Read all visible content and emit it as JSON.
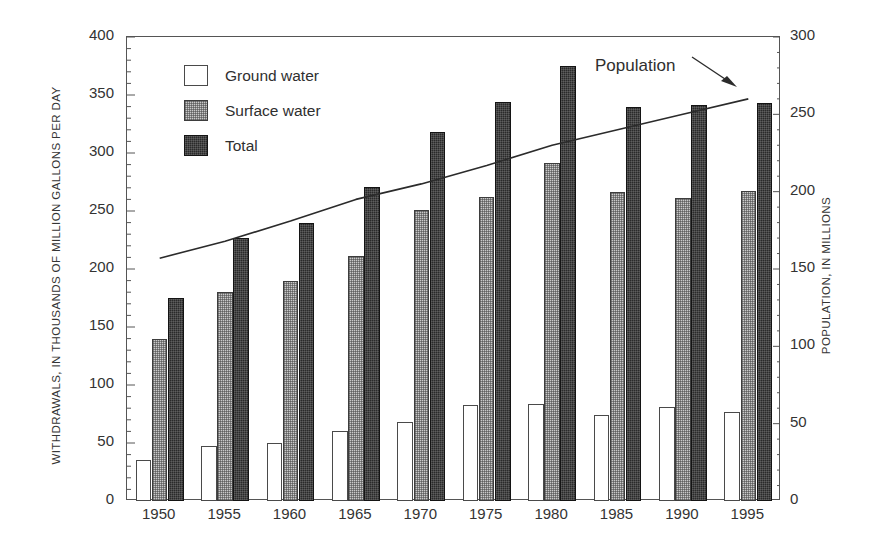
{
  "chart_data": {
    "type": "bar",
    "title": "",
    "subtitle": "",
    "categories": [
      "1950",
      "1955",
      "1960",
      "1965",
      "1970",
      "1975",
      "1980",
      "1985",
      "1990",
      "1995"
    ],
    "xlabel": "",
    "ylabel": "WITHDRAWALS, IN THOUSANDS OF MILLION GALLONS PER DAY",
    "ylabel_right": "POPULATION, IN MILLIONS",
    "ylim": [
      0,
      400
    ],
    "ylim_right": [
      0,
      300
    ],
    "yticks": [
      "400",
      "350",
      "300",
      "250",
      "200",
      "150",
      "100",
      "50",
      "0"
    ],
    "yticks_right": [
      "300",
      "250",
      "200",
      "150",
      "100",
      "50",
      "0"
    ],
    "grid": false,
    "legend_position": "upper-left",
    "series": [
      {
        "name": "Ground water",
        "kind": "bar",
        "axis": "left",
        "values": [
          35,
          47,
          50,
          60,
          68,
          83,
          84,
          74,
          81,
          77
        ]
      },
      {
        "name": "Surface water",
        "kind": "bar",
        "axis": "left",
        "values": [
          140,
          180,
          190,
          211,
          251,
          262,
          291,
          266,
          261,
          267
        ]
      },
      {
        "name": "Total",
        "kind": "bar",
        "axis": "left",
        "values": [
          175,
          227,
          240,
          271,
          318,
          344,
          375,
          340,
          341,
          343
        ]
      },
      {
        "name": "Population",
        "kind": "line",
        "axis": "right",
        "values": [
          157,
          168,
          181,
          195,
          205,
          217,
          230,
          240,
          250,
          260
        ]
      }
    ],
    "annotations": [
      {
        "name": "population-label",
        "text": "Population",
        "points_to": "population-line"
      }
    ]
  },
  "legend": {
    "items": [
      {
        "label": "Ground water",
        "swatch": "ground"
      },
      {
        "label": "Surface water",
        "swatch": "surface"
      },
      {
        "label": "Total",
        "swatch": "total"
      }
    ]
  }
}
